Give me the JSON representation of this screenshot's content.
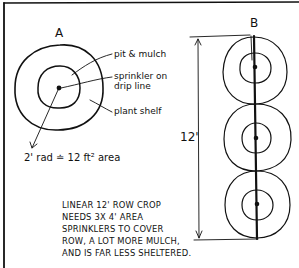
{
  "diagram": {
    "panel_a": {
      "title": "A",
      "labels": {
        "pit_mulch": "pit & mulch",
        "sprinkler_line1": "sprinkler on",
        "sprinkler_line2": "drip line",
        "plant_shelf": "plant shelf"
      },
      "radius_note": "2' rad ≐ 12 ft² area"
    },
    "panel_b": {
      "title": "B",
      "length_label": "12'",
      "circle_count": 3
    },
    "caption": [
      "LINEAR 12' ROW CROP",
      "NEEDS 3X 4' AREA",
      "SPRINKLERS TO COVER",
      "ROW, A LOT MORE MULCH,",
      "AND IS FAR LESS SHELTERED."
    ],
    "colors": {
      "ink": "#111111",
      "paper": "#ffffff"
    }
  }
}
